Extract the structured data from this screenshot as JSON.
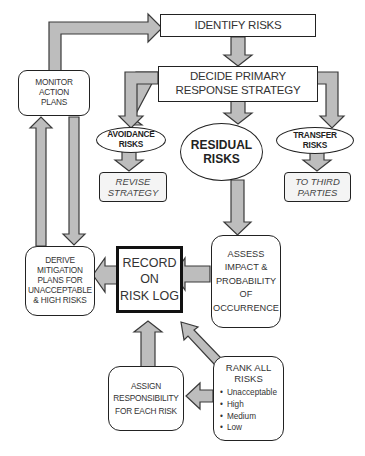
{
  "diagram": {
    "type": "flowchart",
    "colors": {
      "arrow_fill": "#bdbdbd",
      "arrow_stroke": "#3a3a3a",
      "box_border": "#222222",
      "text": "#333333"
    },
    "nodes": {
      "identify": {
        "lines": [
          "IDENTIFY RISKS"
        ]
      },
      "decide": {
        "lines": [
          "DECIDE PRIMARY",
          "RESPONSE STRATEGY"
        ]
      },
      "monitor": {
        "lines": [
          "MONITOR",
          "ACTION",
          "PLANS"
        ]
      },
      "avoidance": {
        "lines": [
          "AVOIDANCE",
          "RISKS"
        ]
      },
      "residual": {
        "lines": [
          "RESIDUAL",
          "RISKS"
        ]
      },
      "transfer": {
        "lines": [
          "TRANSFER",
          "RISKS"
        ]
      },
      "revise": {
        "lines": [
          "REVISE",
          "STRATEGY"
        ]
      },
      "third_parties": {
        "lines": [
          "TO THIRD",
          "PARTIES"
        ]
      },
      "derive": {
        "lines": [
          "DERIVE",
          "MITIGATION",
          "PLANS FOR",
          "UNACCEPTABLE",
          "& HIGH RISKS"
        ]
      },
      "record": {
        "lines": [
          "RECORD",
          "ON",
          "RISK LOG"
        ]
      },
      "assess": {
        "lines": [
          "ASSESS",
          "IMPACT &",
          "PROBABILITY",
          "OF",
          "OCCURRENCE"
        ]
      },
      "assign": {
        "lines": [
          "ASSIGN",
          "RESPONSIBILITY",
          "FOR EACH RISK"
        ]
      },
      "rank": {
        "lines": [
          "RANK ALL",
          "RISKS"
        ],
        "levels": [
          "Unacceptable",
          "High",
          "Medium",
          "Low"
        ]
      }
    },
    "edges": [
      {
        "from": "monitor",
        "to": "identify"
      },
      {
        "from": "identify",
        "to": "decide"
      },
      {
        "from": "decide",
        "to": "avoidance"
      },
      {
        "from": "decide",
        "to": "residual"
      },
      {
        "from": "decide",
        "to": "transfer"
      },
      {
        "from": "avoidance",
        "to": "revise"
      },
      {
        "from": "transfer",
        "to": "third_parties"
      },
      {
        "from": "residual",
        "to": "assess"
      },
      {
        "from": "assess",
        "to": "record"
      },
      {
        "from": "assess",
        "to": "rank"
      },
      {
        "from": "rank",
        "to": "record"
      },
      {
        "from": "rank",
        "to": "assign"
      },
      {
        "from": "assign",
        "to": "record"
      },
      {
        "from": "record",
        "to": "derive"
      },
      {
        "from": "derive",
        "to": "monitor"
      },
      {
        "from": "monitor",
        "to": "derive"
      }
    ]
  }
}
